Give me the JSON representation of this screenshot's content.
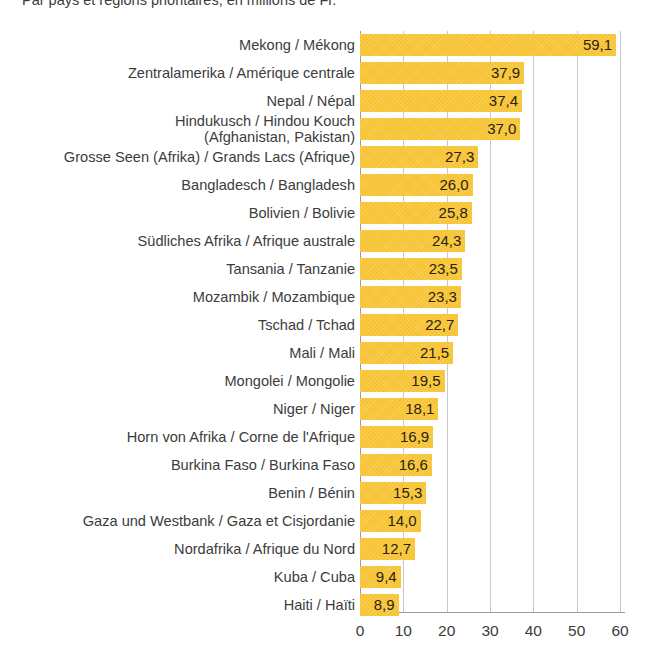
{
  "subtitle": "Par pays et régions prioritaires, en millions de Fr.",
  "colors": {
    "bar": "#f7c331",
    "gridline": "#c9c9c9",
    "axis": "#9a9a9a",
    "label_text": "#3c3c3c",
    "value_text": "#2b2213"
  },
  "chart_data": {
    "type": "bar",
    "orientation": "horizontal",
    "title": "",
    "subtitle": "Par pays et régions prioritaires, en millions de Fr.",
    "xlabel": "",
    "ylabel": "",
    "xlim": [
      0,
      60
    ],
    "xticks": [
      "0",
      "10",
      "20",
      "30",
      "40",
      "50",
      "60"
    ],
    "xtick_values": [
      0,
      10,
      20,
      30,
      40,
      50,
      60
    ],
    "grid": true,
    "grid_axis": "x",
    "legend": false,
    "value_label_format": "comma-decimal",
    "categories": [
      "Mekong / Mékong",
      "Zentralamerika / Amérique centrale",
      "Nepal / Népal",
      "Hindukusch / Hindou Kouch (Afghanistan, Pakistan)",
      "Grosse Seen (Afrika) / Grands Lacs (Afrique)",
      "Bangladesch  / Bangladesh",
      "Bolivien / Bolivie",
      "Südliches Afrika / Afrique australe",
      "Tansania / Tanzanie",
      "Mozambik / Mozambique",
      "Tschad / Tchad",
      "Mali / Mali",
      "Mongolei / Mongolie",
      "Niger / Niger",
      "Horn von Afrika / Corne de l'Afrique",
      "Burkina Faso / Burkina Faso",
      "Benin / Bénin",
      "Gaza und Westbank / Gaza et Cisjordanie",
      "Nordafrika / Afrique du Nord",
      "Kuba / Cuba",
      "Haiti / Haïti"
    ],
    "values": [
      59.1,
      37.9,
      37.4,
      37.0,
      27.3,
      26.0,
      25.8,
      24.3,
      23.5,
      23.3,
      22.7,
      21.5,
      19.5,
      18.1,
      16.9,
      16.6,
      15.3,
      14.0,
      12.7,
      9.4,
      8.9
    ],
    "value_labels": [
      "59,1",
      "37,9",
      "37,4",
      "37,0",
      "27,3",
      "26,0",
      "25,8",
      "24,3",
      "23,5",
      "23,3",
      "22,7",
      "21,5",
      "19,5",
      "18,1",
      "16,9",
      "16,6",
      "15,3",
      "14,0",
      "12,7",
      "9,4",
      "8,9"
    ]
  },
  "rows": [
    {
      "label_line1": "Mekong / Mékong",
      "label_line2": "",
      "value": 59.1,
      "value_label": "59,1"
    },
    {
      "label_line1": "Zentralamerika / Amérique centrale",
      "label_line2": "",
      "value": 37.9,
      "value_label": "37,9"
    },
    {
      "label_line1": "Nepal / Népal",
      "label_line2": "",
      "value": 37.4,
      "value_label": "37,4"
    },
    {
      "label_line1": "Hindukusch / Hindou Kouch",
      "label_line2": "(Afghanistan, Pakistan)",
      "value": 37.0,
      "value_label": "37,0"
    },
    {
      "label_line1": "Grosse Seen (Afrika) / Grands Lacs (Afrique)",
      "label_line2": "",
      "value": 27.3,
      "value_label": "27,3"
    },
    {
      "label_line1": "Bangladesch  / Bangladesh",
      "label_line2": "",
      "value": 26.0,
      "value_label": "26,0"
    },
    {
      "label_line1": "Bolivien / Bolivie",
      "label_line2": "",
      "value": 25.8,
      "value_label": "25,8"
    },
    {
      "label_line1": "Südliches Afrika / Afrique australe",
      "label_line2": "",
      "value": 24.3,
      "value_label": "24,3"
    },
    {
      "label_line1": "Tansania / Tanzanie",
      "label_line2": "",
      "value": 23.5,
      "value_label": "23,5"
    },
    {
      "label_line1": "Mozambik / Mozambique",
      "label_line2": "",
      "value": 23.3,
      "value_label": "23,3"
    },
    {
      "label_line1": "Tschad / Tchad",
      "label_line2": "",
      "value": 22.7,
      "value_label": "22,7"
    },
    {
      "label_line1": "Mali / Mali",
      "label_line2": "",
      "value": 21.5,
      "value_label": "21,5"
    },
    {
      "label_line1": "Mongolei / Mongolie",
      "label_line2": "",
      "value": 19.5,
      "value_label": "19,5"
    },
    {
      "label_line1": "Niger / Niger",
      "label_line2": "",
      "value": 18.1,
      "value_label": "18,1"
    },
    {
      "label_line1": "Horn von Afrika / Corne de l'Afrique",
      "label_line2": "",
      "value": 16.9,
      "value_label": "16,9"
    },
    {
      "label_line1": "Burkina Faso / Burkina Faso",
      "label_line2": "",
      "value": 16.6,
      "value_label": "16,6"
    },
    {
      "label_line1": "Benin / Bénin",
      "label_line2": "",
      "value": 15.3,
      "value_label": "15,3"
    },
    {
      "label_line1": "Gaza und Westbank / Gaza et Cisjordanie",
      "label_line2": "",
      "value": 14.0,
      "value_label": "14,0"
    },
    {
      "label_line1": "Nordafrika / Afrique du Nord",
      "label_line2": "",
      "value": 12.7,
      "value_label": "12,7"
    },
    {
      "label_line1": "Kuba / Cuba",
      "label_line2": "",
      "value": 9.4,
      "value_label": "9,4"
    },
    {
      "label_line1": "Haiti / Haïti",
      "label_line2": "",
      "value": 8.9,
      "value_label": "8,9"
    }
  ]
}
